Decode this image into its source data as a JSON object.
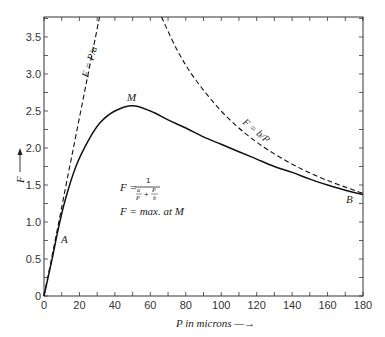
{
  "chart_data": {
    "type": "line",
    "title": "",
    "xlabel": "P in microns",
    "ylabel": "F",
    "xlim": [
      0,
      180
    ],
    "ylim": [
      0,
      3.77
    ],
    "xticks_major": [
      0,
      20,
      40,
      60,
      80,
      100,
      120,
      140,
      160,
      180
    ],
    "xticks_minor_step": 10,
    "yticks_major": [
      0,
      0.5,
      1.0,
      1.5,
      2.0,
      2.5,
      3.0,
      3.5
    ],
    "ytick_labels": [
      "0",
      "0.5",
      "1.0",
      "1.5",
      "2.0",
      "2.5",
      "3.0",
      "3.5"
    ],
    "yticks_minor_step": 0.25,
    "grid": false,
    "series": [
      {
        "name": "F = 1/(a/P + P/b)",
        "style": "solid",
        "x": [
          0,
          5,
          8,
          12,
          18,
          25,
          32,
          40,
          50,
          60,
          70,
          80,
          90,
          100,
          110,
          120,
          130,
          140,
          150,
          160,
          170,
          180
        ],
        "values": [
          0,
          0.55,
          0.9,
          1.3,
          1.75,
          2.1,
          2.35,
          2.5,
          2.57,
          2.5,
          2.38,
          2.27,
          2.15,
          2.05,
          1.95,
          1.85,
          1.75,
          1.67,
          1.58,
          1.5,
          1.43,
          1.37
        ]
      },
      {
        "name": "F = P/a",
        "style": "dashed",
        "x": [
          0,
          8,
          16,
          24,
          31.3
        ],
        "values": [
          0,
          0.96,
          1.93,
          2.89,
          3.77
        ]
      },
      {
        "name": "F = b/P",
        "style": "dashed",
        "x": [
          66.3,
          75,
          85,
          100,
          115,
          130,
          145,
          160,
          175,
          180
        ],
        "values": [
          3.77,
          3.33,
          2.94,
          2.5,
          2.17,
          1.92,
          1.72,
          1.56,
          1.43,
          1.39
        ]
      }
    ],
    "annotations": [
      {
        "text": "M",
        "x": 50,
        "y": 2.65,
        "note": "maximum point"
      },
      {
        "text": "A",
        "x": 10,
        "y": 0.78
      },
      {
        "text": "B",
        "x": 170,
        "y": 1.25
      },
      {
        "text": "F = P/a",
        "note": "label along rising dashed line"
      },
      {
        "text": "F = b/P",
        "note": "label along falling dashed line"
      },
      {
        "text": "F = 1 / (a/P + P/b)",
        "note": "formula box"
      },
      {
        "text": "F = max. at M"
      }
    ]
  },
  "labels": {
    "x_axis": "P in microns —→",
    "y_axis": "F",
    "point_m": "M",
    "point_a": "A",
    "point_b": "B",
    "line_pa": "F = P/a",
    "line_bp": "F = b/P",
    "formula_lhs": "F =",
    "formula_num": "1",
    "formula_den_a": "a",
    "formula_den_p1": "P",
    "formula_den_plus": "+",
    "formula_den_p2": "P",
    "formula_den_b": "b",
    "formula_max": "F = max. at M"
  }
}
